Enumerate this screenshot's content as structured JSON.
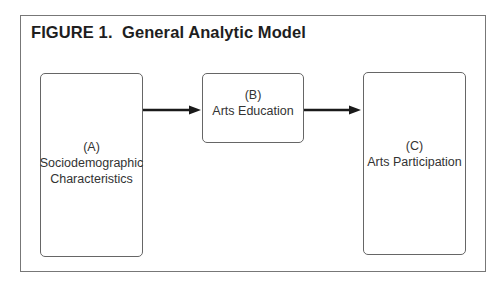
{
  "figure": {
    "title": "FIGURE 1.  General Analytic Model"
  },
  "nodes": [
    {
      "id": "A",
      "label": "(A)",
      "lines": [
        "Sociodemographic",
        "Characteristics"
      ]
    },
    {
      "id": "B",
      "label": "(B)",
      "lines": [
        "Arts Education"
      ]
    },
    {
      "id": "C",
      "label": "(C)",
      "lines": [
        "Arts Participation"
      ]
    }
  ],
  "edges": [
    {
      "from": "A",
      "to": "B"
    },
    {
      "from": "B",
      "to": "C"
    }
  ],
  "colors": {
    "frame": "#777777",
    "box_border": "#666666",
    "arrow": "#1a1a1a",
    "text": "#333333"
  }
}
